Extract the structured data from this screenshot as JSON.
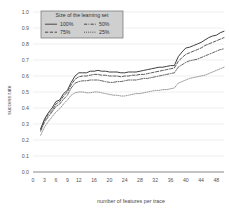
{
  "chart_data": {
    "type": "line",
    "title": "",
    "xlabel": "number of features per trace",
    "ylabel": "success rate",
    "xlim": [
      0,
      50
    ],
    "ylim": [
      0.0,
      1.0
    ],
    "grid": true,
    "legend_position": "top-left",
    "legend_title": "Size of the learning set",
    "xticks": [
      0,
      3,
      6,
      9,
      12,
      16,
      20,
      24,
      28,
      32,
      36,
      40,
      44,
      48
    ],
    "xtick_labels": [
      "0",
      "3",
      "6",
      "9",
      "12",
      "16",
      "20",
      "24",
      "28",
      "32",
      "36",
      "40",
      "44",
      "48"
    ],
    "yticks": [
      0.0,
      0.1,
      0.2,
      0.3,
      0.4,
      0.5,
      0.6,
      0.7,
      0.8,
      0.9,
      1.0
    ],
    "ytick_labels": [
      "0.0",
      "0.1",
      "0.2",
      "0.3",
      "0.4",
      "0.5",
      "0.6",
      "0.7",
      "0.8",
      "0.9",
      "1.0"
    ],
    "x": [
      2,
      3,
      4,
      5,
      6,
      7,
      8,
      9,
      10,
      11,
      12,
      13,
      14,
      15,
      16,
      17,
      18,
      19,
      20,
      21,
      22,
      23,
      24,
      25,
      26,
      27,
      28,
      29,
      30,
      31,
      32,
      33,
      34,
      35,
      36,
      37,
      38,
      39,
      40,
      41,
      42,
      43,
      44,
      45,
      46,
      47,
      48,
      49,
      50
    ],
    "series": [
      {
        "name": "100%",
        "style": "solid",
        "color": "#404040",
        "values": [
          0.27,
          0.33,
          0.37,
          0.4,
          0.44,
          0.45,
          0.49,
          0.51,
          0.56,
          0.6,
          0.62,
          0.62,
          0.62,
          0.63,
          0.63,
          0.635,
          0.63,
          0.63,
          0.625,
          0.625,
          0.625,
          0.62,
          0.62,
          0.625,
          0.625,
          0.625,
          0.63,
          0.635,
          0.64,
          0.645,
          0.65,
          0.655,
          0.655,
          0.66,
          0.665,
          0.665,
          0.72,
          0.75,
          0.775,
          0.78,
          0.79,
          0.8,
          0.81,
          0.825,
          0.84,
          0.85,
          0.855,
          0.87,
          0.88
        ]
      },
      {
        "name": "75%",
        "style": "dashed",
        "color": "#4a4a4a",
        "values": [
          0.265,
          0.32,
          0.36,
          0.385,
          0.425,
          0.44,
          0.475,
          0.5,
          0.545,
          0.58,
          0.595,
          0.6,
          0.6,
          0.605,
          0.61,
          0.61,
          0.605,
          0.605,
          0.6,
          0.6,
          0.6,
          0.595,
          0.6,
          0.6,
          0.605,
          0.605,
          0.61,
          0.61,
          0.615,
          0.62,
          0.625,
          0.63,
          0.635,
          0.64,
          0.645,
          0.65,
          0.69,
          0.715,
          0.735,
          0.745,
          0.755,
          0.765,
          0.775,
          0.79,
          0.8,
          0.81,
          0.82,
          0.83,
          0.84
        ]
      },
      {
        "name": "50%",
        "style": "dashdot",
        "color": "#555555",
        "values": [
          0.255,
          0.31,
          0.345,
          0.375,
          0.41,
          0.425,
          0.455,
          0.48,
          0.525,
          0.555,
          0.565,
          0.57,
          0.57,
          0.575,
          0.575,
          0.575,
          0.57,
          0.565,
          0.56,
          0.56,
          0.565,
          0.565,
          0.57,
          0.575,
          0.575,
          0.575,
          0.58,
          0.585,
          0.585,
          0.59,
          0.595,
          0.6,
          0.605,
          0.61,
          0.615,
          0.62,
          0.655,
          0.67,
          0.685,
          0.695,
          0.7,
          0.705,
          0.715,
          0.725,
          0.735,
          0.745,
          0.755,
          0.765,
          0.77
        ]
      },
      {
        "name": "25%",
        "style": "dotted",
        "color": "#8a8a8a",
        "values": [
          0.23,
          0.28,
          0.315,
          0.345,
          0.375,
          0.395,
          0.425,
          0.45,
          0.48,
          0.495,
          0.5,
          0.5,
          0.495,
          0.495,
          0.5,
          0.5,
          0.495,
          0.49,
          0.485,
          0.48,
          0.48,
          0.475,
          0.475,
          0.48,
          0.485,
          0.49,
          0.49,
          0.495,
          0.5,
          0.505,
          0.51,
          0.51,
          0.515,
          0.515,
          0.52,
          0.525,
          0.555,
          0.565,
          0.575,
          0.585,
          0.59,
          0.595,
          0.6,
          0.605,
          0.615,
          0.625,
          0.635,
          0.645,
          0.655
        ]
      }
    ]
  },
  "legend": {
    "title": "Size of the learning set",
    "entries": [
      {
        "label": "100%",
        "style": "solid"
      },
      {
        "label": "50%",
        "style": "dashdot"
      },
      {
        "label": "75%",
        "style": "dashed"
      },
      {
        "label": "25%",
        "style": "dotted"
      }
    ]
  },
  "axes": {
    "x_title": "number of features per trace",
    "y_title": "success rate"
  }
}
